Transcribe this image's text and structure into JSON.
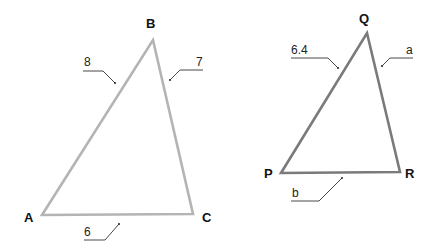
{
  "figure": {
    "triangles": [
      {
        "name": "ABC",
        "stroke_color": "#b4b4b4",
        "vertices": {
          "A": {
            "label": "A",
            "x": 42,
            "y": 215
          },
          "B": {
            "label": "B",
            "x": 153,
            "y": 40
          },
          "C": {
            "label": "C",
            "x": 193,
            "y": 214
          }
        },
        "sides": {
          "AB": {
            "label": "8"
          },
          "BC": {
            "label": "7"
          },
          "AC": {
            "label": "6"
          }
        }
      },
      {
        "name": "PQR",
        "stroke_color": "#7a7a7a",
        "vertices": {
          "P": {
            "label": "P",
            "x": 281,
            "y": 173
          },
          "Q": {
            "label": "Q",
            "x": 367,
            "y": 33
          },
          "R": {
            "label": "R",
            "x": 400,
            "y": 172
          }
        },
        "sides": {
          "PQ": {
            "label": "6.4"
          },
          "QR": {
            "label": "a"
          },
          "PR": {
            "label": "b"
          }
        }
      }
    ]
  }
}
